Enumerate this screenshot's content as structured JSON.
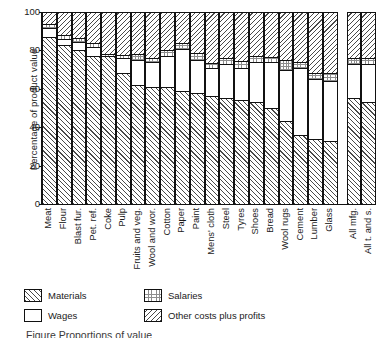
{
  "chart_data": {
    "type": "bar",
    "stacked": true,
    "title": "",
    "xlabel": "",
    "ylabel": "Percentage of product value",
    "ylim": [
      0,
      100
    ],
    "yticks": [
      0,
      20,
      40,
      60,
      80,
      100
    ],
    "grid": false,
    "legend_position": "below-axes",
    "categories": [
      "Meat",
      "Flour",
      "Blast fur.",
      "Pet. ref.",
      "Coke",
      "Pulp",
      "Fruits and veg.",
      "Wool and wor.",
      "Cotton",
      "Paper",
      "Paint",
      "Mens' cloth",
      "Steel",
      "Tyres",
      "Shoes",
      "Bread",
      "Wool rugs",
      "Cement",
      "Lumber",
      "Glass",
      "All mfg.",
      "All t. and s."
    ],
    "series": [
      {
        "name": "Materials",
        "pattern": "diagonal-hatch-right",
        "values": [
          87,
          83,
          80,
          77,
          77,
          68,
          62,
          61,
          61,
          59,
          58,
          56,
          55,
          54,
          53,
          50,
          43,
          36,
          34,
          33,
          55,
          53
        ]
      },
      {
        "name": "Wages",
        "pattern": "solid-white",
        "values": [
          4.5,
          3,
          4.5,
          5,
          0,
          8,
          13,
          13,
          16,
          22,
          17,
          15,
          18,
          17,
          21,
          24,
          27,
          35,
          31,
          31,
          18,
          20
        ]
      },
      {
        "name": "Salaries",
        "pattern": "stipple",
        "values": [
          2.5,
          2,
          2,
          2,
          1,
          1.5,
          3,
          2,
          3,
          3,
          3.5,
          2.5,
          3,
          3.5,
          3,
          2.5,
          5,
          3,
          3,
          4,
          3,
          3
        ]
      },
      {
        "name": "Other costs plus profits",
        "pattern": "diagonal-hatch-left",
        "values": [
          6,
          12,
          13.5,
          16,
          22,
          22.5,
          22,
          24,
          20,
          16,
          21.5,
          26.5,
          24,
          25.5,
          23,
          23.5,
          25,
          26,
          32,
          32,
          24,
          24
        ]
      }
    ],
    "group_gap_after_index": 19
  },
  "legend": {
    "rows": [
      [
        {
          "label": "Materials",
          "pattern": "mat"
        },
        {
          "label": "Salaries",
          "pattern": "sal"
        }
      ],
      [
        {
          "label": "Wages",
          "pattern": "wag"
        },
        {
          "label": "Other costs plus profits",
          "pattern": "oth"
        }
      ]
    ]
  },
  "caption": "Figure   Proportions of value"
}
